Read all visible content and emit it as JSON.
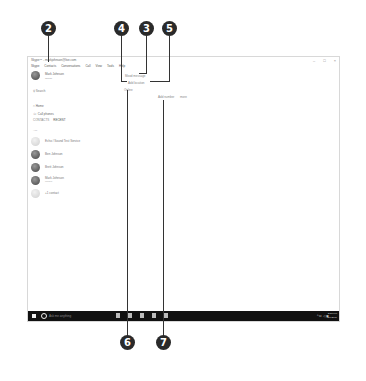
{
  "window": {
    "title": "Skype™ - markjohnson@live.com",
    "controls": [
      "–",
      "□",
      "×"
    ]
  },
  "menu": [
    "Skype",
    "Contacts",
    "Conversations",
    "Call",
    "View",
    "Tools",
    "Help"
  ],
  "profile": {
    "name": "Mark Johnson",
    "status": "Online"
  },
  "search": {
    "label": "Search"
  },
  "nav": [
    {
      "icon": "home-icon",
      "label": "Home"
    },
    {
      "icon": "phone-icon",
      "label": "Call phones"
    }
  ],
  "tabs": [
    {
      "label": "CONTACTS",
      "active": false
    },
    {
      "label": "RECENT",
      "active": true
    }
  ],
  "list_label": "ALL",
  "contacts": [
    {
      "name": "Echo / Sound Test Service",
      "sub": "",
      "light": true
    },
    {
      "name": "Ben Johnson",
      "sub": "",
      "light": false
    },
    {
      "name": "Brett Johnson",
      "sub": "",
      "light": false
    },
    {
      "name": "Mark Johnson",
      "sub": "Mobile",
      "light": false
    },
    {
      "name": "+1 contact",
      "sub": "",
      "light": true
    }
  ],
  "center": {
    "mood": "Mood message",
    "location": "Add location",
    "status": "Online",
    "add_number": "Add number",
    "more": "more"
  },
  "taskbar": {
    "search_placeholder": "Ask me anything",
    "tray": "^ ⊡ ◁ ▣",
    "time": "2:58 PM",
    "date": "2/1/2016"
  },
  "callouts": [
    "2",
    "3",
    "4",
    "5",
    "6",
    "7"
  ]
}
